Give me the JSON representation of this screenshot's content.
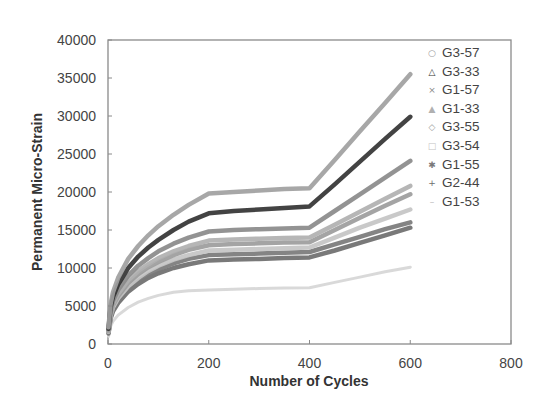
{
  "chart_data": {
    "type": "line",
    "title": "",
    "xlabel": "Number of Cycles",
    "ylabel": "Permanent Micro-Strain",
    "xlim": [
      0,
      800
    ],
    "ylim": [
      0,
      40000
    ],
    "xticks": [
      0,
      200,
      400,
      600,
      800
    ],
    "yticks": [
      0,
      5000,
      10000,
      15000,
      20000,
      25000,
      30000,
      35000,
      40000
    ],
    "grid": false,
    "legend_position": "right-inside-top",
    "x": [
      1,
      5,
      10,
      20,
      40,
      60,
      80,
      100,
      130,
      160,
      200,
      250,
      300,
      350,
      400,
      450,
      500,
      550,
      600
    ],
    "series": [
      {
        "name": "G3-57",
        "marker": "○",
        "color": "#a0a0a0",
        "width": 4.5,
        "values": [
          2200,
          5200,
          6800,
          8700,
          11200,
          12900,
          14300,
          15500,
          17000,
          18300,
          19800,
          20000,
          20200,
          20400,
          20500,
          24200,
          28000,
          31700,
          35500
        ]
      },
      {
        "name": "G3-33",
        "marker": "△",
        "color": "#333333",
        "width": 4.5,
        "values": [
          2000,
          4800,
          6200,
          7800,
          10000,
          11500,
          12700,
          13700,
          15000,
          16100,
          17200,
          17500,
          17700,
          17900,
          18100,
          21000,
          24000,
          27000,
          29900
        ]
      },
      {
        "name": "G1-57",
        "marker": "×",
        "color": "#8a8a8a",
        "width": 4.5,
        "values": [
          1900,
          4400,
          5700,
          7100,
          9000,
          10300,
          11300,
          12200,
          13200,
          14000,
          14800,
          15000,
          15100,
          15200,
          15300,
          17500,
          19700,
          21900,
          24100
        ]
      },
      {
        "name": "G1-33",
        "marker": "▲",
        "color": "#b0b0b0",
        "width": 4.5,
        "values": [
          1800,
          4100,
          5300,
          6600,
          8400,
          9600,
          10500,
          11300,
          12200,
          12900,
          13600,
          13750,
          13850,
          13950,
          14000,
          15700,
          17400,
          19100,
          20800
        ]
      },
      {
        "name": "G3-55",
        "marker": "◇",
        "color": "#9c9c9c",
        "width": 4.5,
        "values": [
          1700,
          3900,
          5100,
          6300,
          8000,
          9200,
          10100,
          10800,
          11700,
          12400,
          13000,
          13150,
          13250,
          13350,
          13400,
          15000,
          16600,
          18200,
          19700
        ]
      },
      {
        "name": "G3-54",
        "marker": "□",
        "color": "#c4c4c4",
        "width": 4.5,
        "values": [
          1600,
          3700,
          4800,
          6000,
          7600,
          8700,
          9600,
          10300,
          11100,
          11700,
          12300,
          12400,
          12500,
          12600,
          12700,
          14000,
          15300,
          16500,
          17700
        ]
      },
      {
        "name": "G1-55",
        "marker": "✱",
        "color": "#7a7a7a",
        "width": 4.5,
        "values": [
          1500,
          3500,
          4600,
          5700,
          7200,
          8300,
          9100,
          9800,
          10600,
          11200,
          11700,
          11800,
          11900,
          12000,
          12100,
          13100,
          14100,
          15100,
          16000
        ]
      },
      {
        "name": "G2-44",
        "marker": "+",
        "color": "#6e6e6e",
        "width": 4.5,
        "values": [
          1400,
          3300,
          4300,
          5400,
          6900,
          7900,
          8700,
          9300,
          10000,
          10500,
          11000,
          11100,
          11200,
          11300,
          11400,
          12300,
          13300,
          14300,
          15300
        ]
      },
      {
        "name": "G1-53",
        "marker": "–",
        "color": "#d6d6d6",
        "width": 3,
        "values": [
          1000,
          2300,
          3000,
          3800,
          4800,
          5500,
          6000,
          6400,
          6800,
          7000,
          7100,
          7200,
          7300,
          7350,
          7400,
          8100,
          8800,
          9500,
          10100
        ]
      }
    ]
  }
}
